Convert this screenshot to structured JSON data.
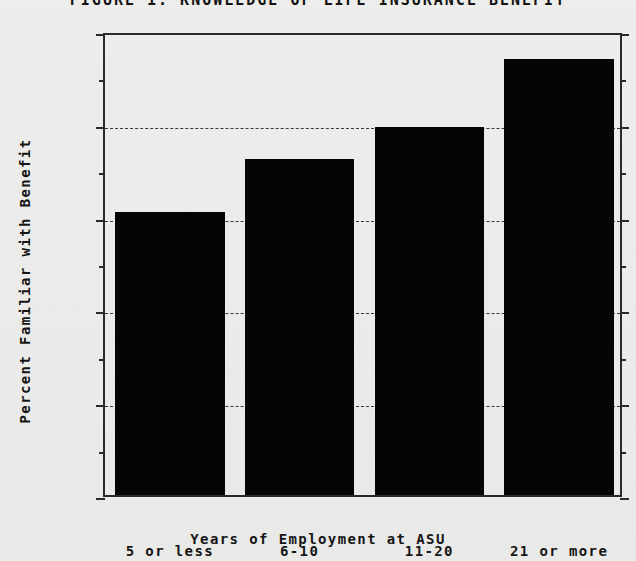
{
  "chart_data": {
    "type": "bar",
    "title": "FIGURE 1.  KNOWLEDGE OF LIFE INSURANCE BENEFIT",
    "categories": [
      "5 or less",
      "6-10",
      "11-20",
      "21 or more"
    ],
    "values": [
      61,
      72.5,
      79.3,
      94
    ],
    "xlabel": "Years of Employment at ASU",
    "ylabel": "Percent Familiar with Benefit",
    "ylim": [
      0,
      100
    ],
    "ytick_labels": [
      "0",
      "20",
      "40",
      "60",
      "80",
      "100"
    ],
    "ytick_values": [
      0,
      20,
      40,
      60,
      80,
      100
    ],
    "minor_tick_values": [
      10,
      30,
      50,
      70,
      90
    ],
    "grid": "horizontal-dashed-major",
    "legend": "none",
    "bar_color": "#050505",
    "background_color": "#ececea"
  }
}
